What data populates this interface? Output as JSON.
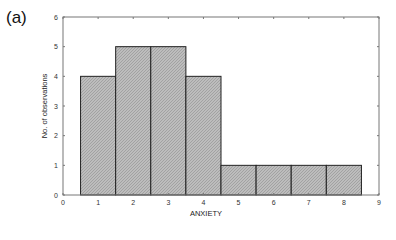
{
  "panel_label": "(a)",
  "chart_data": {
    "type": "bar",
    "subtype": "histogram",
    "title": "",
    "xlabel": "ANXIETY",
    "ylabel": "No. of observations",
    "categories": [
      "1",
      "2",
      "3",
      "4",
      "5",
      "6",
      "7",
      "8"
    ],
    "bin_centers": [
      1,
      2,
      3,
      4,
      5,
      6,
      7,
      8
    ],
    "values": [
      4,
      5,
      5,
      4,
      1,
      1,
      1,
      1
    ],
    "xlim": [
      0,
      9
    ],
    "ylim": [
      0,
      6
    ],
    "xticks": [
      "0",
      "1",
      "2",
      "3",
      "4",
      "5",
      "6",
      "7",
      "8",
      "9"
    ],
    "yticks": [
      "0",
      "1",
      "2",
      "3",
      "4",
      "5",
      "6"
    ],
    "grid": false,
    "legend": null,
    "bar_fill": "#b4b4b4",
    "bar_edge": "#222222"
  }
}
